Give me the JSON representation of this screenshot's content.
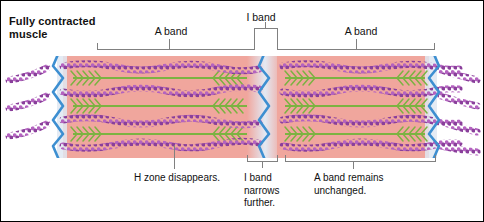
{
  "figure": {
    "title_line1": "Fully contracted",
    "title_line2": "muscle",
    "type": "sarcomere-diagram"
  },
  "top_labels": [
    {
      "name": "a-band-left",
      "text": "A band"
    },
    {
      "name": "i-band-center",
      "text": "I band"
    },
    {
      "name": "a-band-right",
      "text": "A band"
    }
  ],
  "bottom_captions": [
    {
      "name": "h-zone-caption",
      "line1": "H zone disappears.",
      "line2": "",
      "line3": ""
    },
    {
      "name": "i-band-caption",
      "line1": "I band",
      "line2": "narrows",
      "line3": "further."
    },
    {
      "name": "a-band-caption",
      "line1": "A band remains",
      "line2": "unchanged.",
      "line3": ""
    }
  ],
  "colors": {
    "a_band": "#f0a69d",
    "i_band": "#dfe7f2",
    "z_line": "#3d8fd1",
    "thin_filament": "#a34fb0",
    "thin_filament_dark": "#7d3a8f",
    "thick_filament": "#7cb342",
    "bracket": "#808080",
    "text": "#111111",
    "frame": "#000000",
    "background": "#ffffff"
  },
  "structure": {
    "z_line_count": 3,
    "myofibril_rows": 4,
    "h_zone_present": false,
    "sarcomere_state": "fully contracted"
  }
}
